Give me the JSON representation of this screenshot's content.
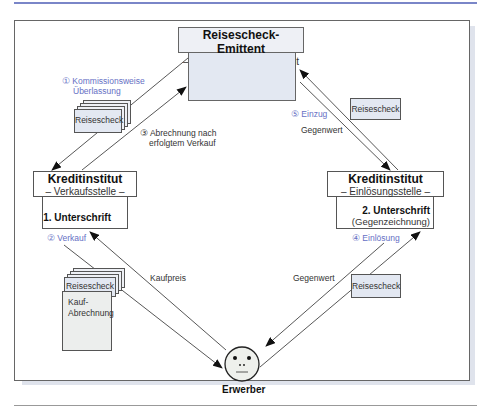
{
  "diagram": {
    "emitter": {
      "title": "Reisescheck-Emittent",
      "subtitle": "– Bezogenes Kreditinstitut –"
    },
    "seller_bank": {
      "title": "Kreditinstitut",
      "subtitle": "– Verkaufsstelle –",
      "note": "1. Unterschrift"
    },
    "redeem_bank": {
      "title": "Kreditinstitut",
      "subtitle": "– Einlösungsstelle –",
      "note": "2. Unterschrift",
      "note2": "(Gegenzeichnung)"
    },
    "buyer": {
      "label": "Erwerber"
    },
    "steps": {
      "s1_a": "① Kommissionsweise",
      "s1_b": "Überlassung",
      "s2": "② Verkauf",
      "s3_a": "③ Abrechnung nach",
      "s3_b": "erfolgtem Verkauf",
      "s4": "④ Einlösung",
      "s5": "⑤ Einzug"
    },
    "labels": {
      "gegenwert_top": "Gegenwert",
      "kaufpreis": "Kaufpreis",
      "gegenwert_bottom": "Gegenwert"
    },
    "documents": {
      "check_left_top": "Reisescheck",
      "check_left_bottom": "Reisescheck",
      "kauf_a": "Kauf-",
      "kauf_b": "Abrechnung",
      "check_right_top": "Reisescheck",
      "check_right_bottom": "Reisescheck"
    },
    "colors": {
      "accent_blue": "#6670c4",
      "box_fill": "#e3e8f2",
      "border": "#555555"
    }
  }
}
